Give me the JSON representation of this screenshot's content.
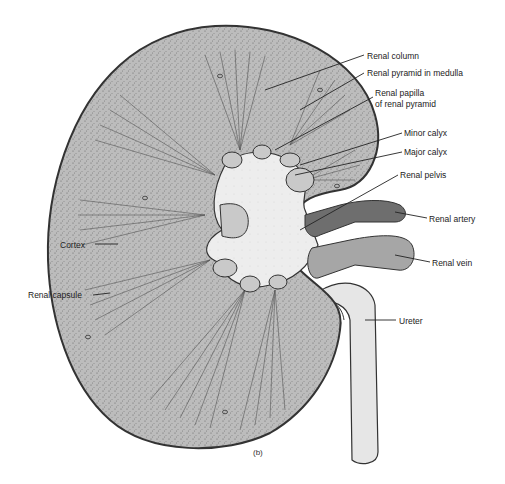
{
  "figure": {
    "caption": "(b)",
    "colors": {
      "cortex": "#b9b9b9",
      "capsule": "#8a8a8a",
      "pelvis": "#ececec",
      "artery": "#6e6e6e",
      "vein": "#a6a6a6",
      "ureter": "#e6e6e6",
      "outline": "#333333"
    }
  },
  "labels": {
    "renal_column": "Renal column",
    "renal_pyramid": "Renal pyramid in medulla",
    "renal_papilla_1": "Renal papilla",
    "renal_papilla_2": "of renal pyramid",
    "minor_calyx": "Minor calyx",
    "major_calyx": "Major calyx",
    "renal_pelvis": "Renal pelvis",
    "renal_artery": "Renal artery",
    "renal_vein": "Renal vein",
    "ureter": "Ureter",
    "cortex": "Cortex",
    "renal_capsule": "Renal capsule"
  }
}
